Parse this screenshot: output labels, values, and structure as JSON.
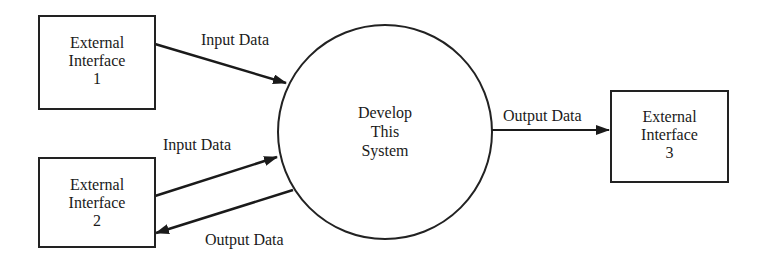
{
  "diagram": {
    "type": "context-diagram",
    "central_process": {
      "label_lines": [
        "Develop",
        "This",
        "System"
      ]
    },
    "external_interfaces": [
      {
        "id": "ext1",
        "label_lines": [
          "External",
          "Interface",
          "1"
        ]
      },
      {
        "id": "ext2",
        "label_lines": [
          "External",
          "Interface",
          "2"
        ]
      },
      {
        "id": "ext3",
        "label_lines": [
          "External",
          "Interface",
          "3"
        ]
      }
    ],
    "flows": [
      {
        "from": "ext1",
        "to": "system",
        "label": "Input Data"
      },
      {
        "from": "ext2",
        "to": "system",
        "label": "Input Data"
      },
      {
        "from": "system",
        "to": "ext2",
        "label": "Output Data"
      },
      {
        "from": "system",
        "to": "ext3",
        "label": "Output Data"
      }
    ]
  }
}
